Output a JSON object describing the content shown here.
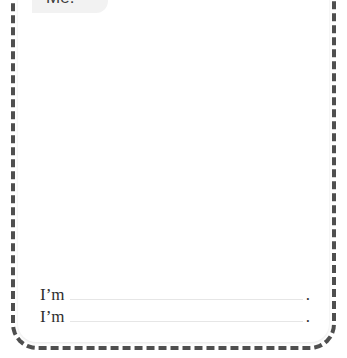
{
  "worksheet": {
    "tab": {
      "label": "Me!"
    },
    "prompts": [
      {
        "lead": "I’m",
        "answer": "",
        "placeholder": "",
        "terminator": "."
      },
      {
        "lead": "I’m",
        "answer": "",
        "placeholder": "",
        "terminator": "."
      }
    ]
  },
  "colors": {
    "frame_dash": "#4f4f4f",
    "card_background": "#ffffff",
    "tab_background": "#f2f2f2",
    "tab_text": "#3a3a3a",
    "prompt_text": "#2e2e2e",
    "blank_rule": "#e6e6e6"
  }
}
